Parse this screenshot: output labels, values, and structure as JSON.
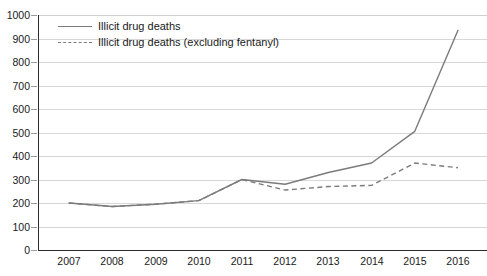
{
  "chart_data": {
    "type": "line",
    "title": "",
    "subtitle": "",
    "xlabel": "",
    "ylabel": "",
    "categories": [
      "2007",
      "2008",
      "2009",
      "2010",
      "2011",
      "2012",
      "2013",
      "2014",
      "2015",
      "2016"
    ],
    "x": [
      2007,
      2008,
      2009,
      2010,
      2011,
      2012,
      2013,
      2014,
      2015,
      2016
    ],
    "ylim": [
      0,
      1000
    ],
    "ytick_labels": [
      "0",
      "100",
      "200",
      "300",
      "400",
      "500",
      "600",
      "700",
      "800",
      "900",
      "1000"
    ],
    "ytick_values": [
      0,
      100,
      200,
      300,
      400,
      500,
      600,
      700,
      800,
      900,
      1000
    ],
    "grid": true,
    "legend_position": "top-left",
    "series": [
      {
        "name": "Illicit drug deaths",
        "style": "solid",
        "color": "#7b7b7b",
        "values": [
          200,
          185,
          195,
          210,
          300,
          280,
          330,
          370,
          505,
          935
        ]
      },
      {
        "name": "Illicit drug deaths (excluding fentanyl)",
        "style": "dashed",
        "color": "#7b7b7b",
        "values": [
          200,
          185,
          195,
          210,
          300,
          255,
          270,
          275,
          370,
          350
        ]
      }
    ]
  },
  "legend": {
    "items": [
      {
        "label": "Illicit drug deaths",
        "style": "solid"
      },
      {
        "label": "Illicit drug deaths (excluding fentanyl)",
        "style": "dashed"
      }
    ]
  },
  "axes": {
    "y": {
      "ticks": [
        "1000",
        "900",
        "800",
        "700",
        "600",
        "500",
        "400",
        "300",
        "200",
        "100",
        "0"
      ]
    },
    "x": {
      "ticks": [
        "2007",
        "2008",
        "2009",
        "2010",
        "2011",
        "2012",
        "2013",
        "2014",
        "2015",
        "2016"
      ]
    }
  }
}
